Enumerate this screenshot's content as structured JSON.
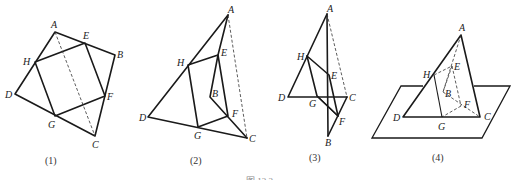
{
  "figures": [
    {
      "caption": "(1)",
      "points": {
        "A": "A",
        "B": "B",
        "C": "C",
        "D": "D",
        "E": "E",
        "F": "F",
        "G": "G",
        "H": "H"
      }
    },
    {
      "caption": "(2)",
      "points": {
        "A": "A",
        "B": "B",
        "C": "C",
        "D": "D",
        "E": "E",
        "F": "F",
        "G": "G",
        "H": "H"
      }
    },
    {
      "caption": "(3)",
      "points": {
        "A": "A",
        "B": "B",
        "C": "C",
        "D": "D",
        "E": "E",
        "F": "F",
        "G": "G",
        "H": "H"
      }
    },
    {
      "caption": "(4)",
      "points": {
        "A": "A",
        "B": "B",
        "C": "C",
        "D": "D",
        "E": "E",
        "F": "F",
        "G": "G",
        "H": "H"
      }
    }
  ],
  "figure_caption": "图 12.2"
}
